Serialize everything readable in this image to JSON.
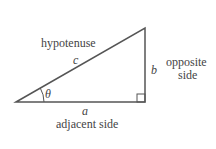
{
  "diagram": {
    "type": "right-triangle",
    "labels": {
      "hypotenuse": "hypotenuse",
      "c": "c",
      "b": "b",
      "opposite_line1": "opposite",
      "opposite_line2": "side",
      "theta": "θ",
      "a": "a",
      "adjacent": "adjacent side"
    },
    "colors": {
      "line": "#555555",
      "text": "#444444"
    }
  }
}
